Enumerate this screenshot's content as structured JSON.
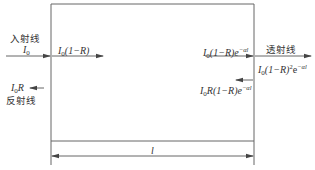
{
  "diagram": {
    "type": "light propagation through slab",
    "labels": {
      "incident_cn": "入射线",
      "incident_I": "I",
      "incident_sub": "0",
      "refracted_in_I": "I",
      "refracted_in_sub": "0",
      "refracted_in_rest": "(1−R)",
      "reflected_I": "I",
      "reflected_sub": "0",
      "reflected_R": "R",
      "reflected_cn": "反射线",
      "inner_right_I": "I",
      "inner_right_sub": "0",
      "inner_right_rest": "(1−R)e",
      "inner_right_exp": "−αl",
      "transmitted_cn": "透射线",
      "transmitted_I": "I",
      "transmitted_sub": "0",
      "transmitted_rest": "(1−R)",
      "transmitted_sq": "2",
      "transmitted_e": "e",
      "transmitted_exp": "−αl",
      "back_reflect_I": "I",
      "back_reflect_sub": "0",
      "back_reflect_rest": "R(1−R)e",
      "back_reflect_exp": "−αl",
      "thickness": "l"
    },
    "colors": {
      "line": "#555555",
      "text": "#333333"
    }
  }
}
